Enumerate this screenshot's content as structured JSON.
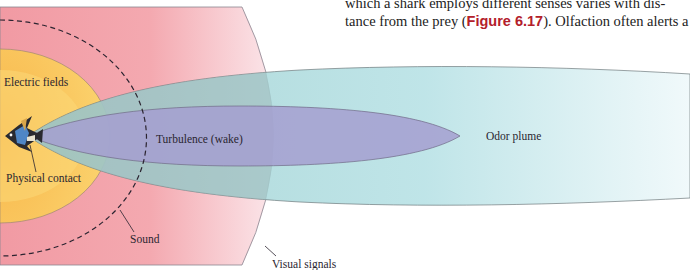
{
  "body_text": {
    "line1": "which a shark employs different senses varies with dis-",
    "line2_pre": "tance from the prey (",
    "figure_ref": "Figure 6.17",
    "line2_post": "). Olfaction often alerts a"
  },
  "diagram": {
    "labels": {
      "electric_fields": "Electric fields",
      "physical_contact": "Physical contact",
      "turbulence": "Turbulence (wake)",
      "odor_plume": "Odor plume",
      "sound": "Sound",
      "visual_signals": "Visual signals"
    },
    "colors": {
      "visual_region": "#f2a0a8",
      "electric_region": "#f8c85a",
      "odor_plume": "#9fd6d6",
      "turbulence": "#a9a3cf",
      "figure_ref": "#b3202a",
      "outline": "#7d7a80",
      "sound_dash": "#2b2430"
    }
  }
}
